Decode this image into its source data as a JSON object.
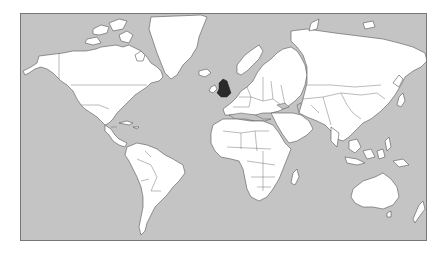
{
  "map": {
    "type": "world-political-mercator",
    "colors": {
      "ocean": "#c4c4c4",
      "land": "#ffffff",
      "borders": "#555555",
      "highlight": "#2a2a2a"
    },
    "highlighted_regions": [
      "United Kingdom"
    ]
  }
}
